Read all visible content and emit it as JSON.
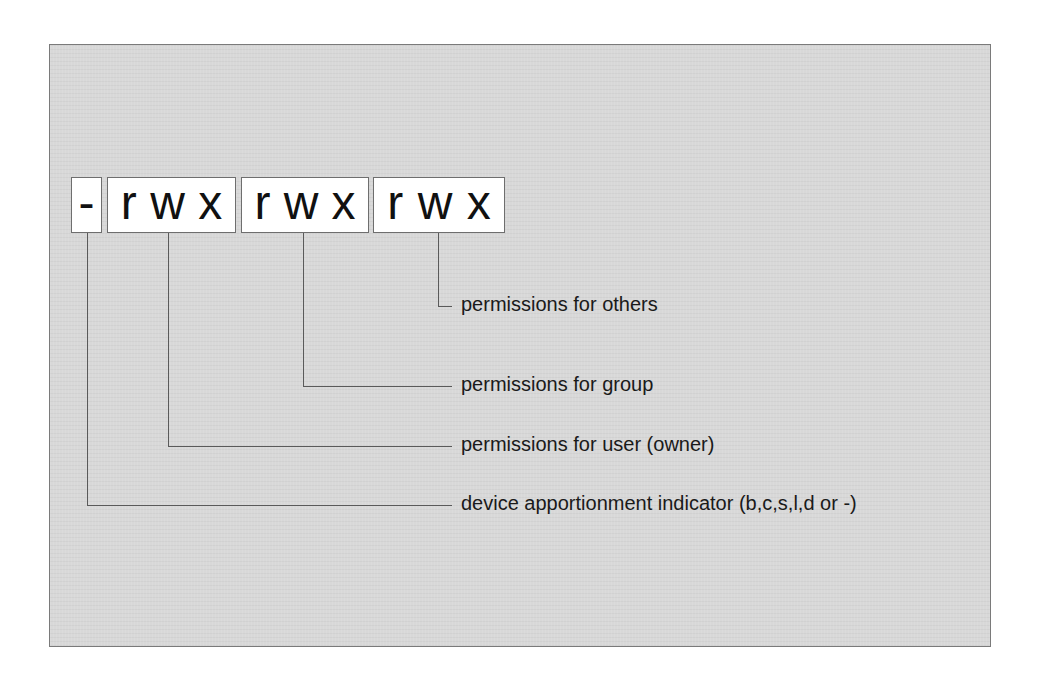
{
  "diagram": {
    "title": "",
    "permission_string": {
      "type_indicator": "-",
      "groups": [
        {
          "name": "user",
          "chars": [
            "r",
            "w",
            "x"
          ]
        },
        {
          "name": "group",
          "chars": [
            "r",
            "w",
            "x"
          ]
        },
        {
          "name": "others",
          "chars": [
            "r",
            "w",
            "x"
          ]
        }
      ]
    },
    "labels": {
      "others": "permissions for others",
      "group": "permissions for group",
      "user": "permissions for user (owner)",
      "device": "device apportionment indicator (b,c,s,l,d or -)"
    },
    "colors": {
      "background": "#d8d8d8",
      "frame_border": "#7a7a7a",
      "box_fill": "#ffffff",
      "line": "#5a5a5a",
      "text": "#1a1a1a"
    }
  }
}
